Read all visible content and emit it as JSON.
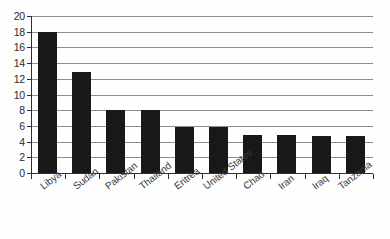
{
  "chart_data": {
    "type": "bar",
    "title": "",
    "subtitle": "",
    "xlabel": "",
    "ylabel": "",
    "ylim": [
      0,
      20
    ],
    "y_tick_step": 2,
    "y_ticks": [
      0,
      2,
      4,
      6,
      8,
      10,
      12,
      14,
      16,
      18,
      20
    ],
    "grid": "horizontal",
    "legend": "none",
    "bar_color": "#181818",
    "gridline_color": "#8e8e8e",
    "axis_color": "#2f2f2f",
    "background_color": "#fefefe",
    "categories": [
      "Libya",
      "Sudan",
      "Pakistan",
      "Thailand",
      "Eritrea",
      "United States",
      "Chad",
      "Iran",
      "Iraq",
      "Tanzania"
    ],
    "values": [
      18,
      12.9,
      8,
      8,
      5.9,
      5.9,
      4.8,
      4.8,
      4.7,
      4.7
    ]
  }
}
